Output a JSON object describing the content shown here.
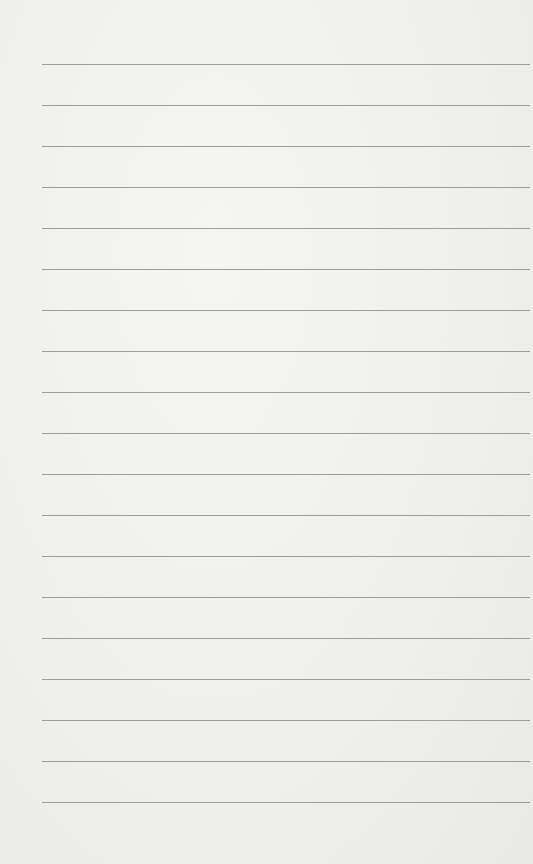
{
  "image": {
    "description": "Blank lined notebook paper",
    "background_color": "#f1f1f0",
    "line_color": "#8e8e8e",
    "line_left_px": 42,
    "line_right_px": 530,
    "first_line_y": 64,
    "line_spacing_px": 41,
    "line_count": 19
  }
}
